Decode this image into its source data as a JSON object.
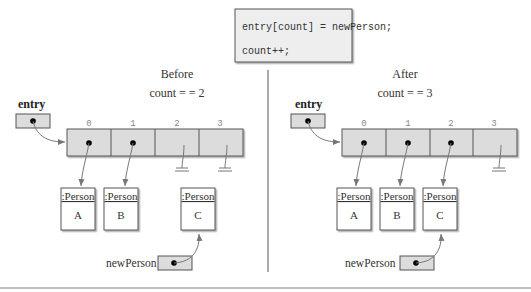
{
  "code": {
    "line1": "entry[count] = newPerson;",
    "line2": "count++;"
  },
  "before": {
    "title": "Before",
    "count_label": "count = = 2",
    "entry_label": "entry",
    "indices": [
      "0",
      "1",
      "2",
      "3"
    ],
    "persons": [
      {
        "type": ":Person",
        "name": "A"
      },
      {
        "type": ":Person",
        "name": "B"
      },
      {
        "type": ":Person",
        "name": "C"
      }
    ],
    "newperson_label": "newPerson"
  },
  "after": {
    "title": "After",
    "count_label": "count = = 3",
    "entry_label": "entry",
    "indices": [
      "0",
      "1",
      "2",
      "3"
    ],
    "persons": [
      {
        "type": ":Person",
        "name": "A"
      },
      {
        "type": ":Person",
        "name": "B"
      },
      {
        "type": ":Person",
        "name": "C"
      }
    ],
    "newperson_label": "newPerson"
  },
  "colors": {
    "cell_fill": "#dcdcdc",
    "box_border": "#555555",
    "arrow": "#777777",
    "divider": "#aaaaaa",
    "index_text": "#888888"
  }
}
